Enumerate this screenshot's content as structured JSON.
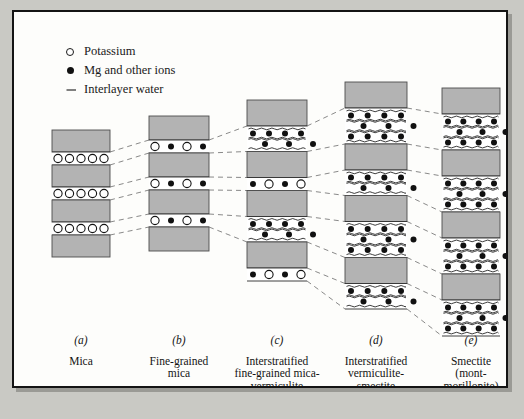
{
  "figure": {
    "legend": [
      {
        "marker": "open-circle",
        "label": "Potassium"
      },
      {
        "marker": "filled-circle",
        "label": "Mg and other ions"
      },
      {
        "marker": "wavy-dash",
        "label": "Interlayer water"
      }
    ],
    "columns": [
      {
        "index": "(a)",
        "name": "Mica",
        "name_lines": [
          "Mica"
        ],
        "x": 38,
        "width": 58,
        "top": 118,
        "slab_h": 22,
        "gap_h": 12,
        "units": 4,
        "ion_rows": [
          {
            "pattern": "KKKKK",
            "count": 5
          }
        ],
        "water": false,
        "ions": [
          "potassium"
        ]
      },
      {
        "index": "(b)",
        "name": "Fine-grained mica",
        "name_lines": [
          "Fine-grained",
          "mica"
        ],
        "x": 135,
        "width": 60,
        "top": 104,
        "slab_h": 24,
        "gap_h": 14,
        "units": 4,
        "ion_rows": [
          {
            "pattern": "KMKM",
            "count": 4
          }
        ],
        "water": false,
        "ions": [
          "potassium",
          "magnesium"
        ]
      },
      {
        "index": "(c)",
        "name": "Interstratified fine-grained mica-vermiculite",
        "name_lines": [
          "Interstratified",
          "fine-grained mica-",
          "vermiculite"
        ],
        "x": 233,
        "width": 60,
        "top": 88,
        "slab_h": 26,
        "units": 4,
        "ion_rows": [
          {
            "pattern": "MKMK",
            "count": 4
          },
          {
            "pattern": "MMMM",
            "count": 4
          }
        ],
        "water": true,
        "ions": [
          "potassium",
          "magnesium"
        ]
      },
      {
        "index": "(d)",
        "name": "Interstratified vermiculite-smectite",
        "name_lines": [
          "Interstratified",
          "vermiculite-",
          "smectite"
        ],
        "x": 331,
        "width": 62,
        "top": 70,
        "slab_h": 26,
        "units": 4,
        "ion_rows": [
          {
            "pattern": "MMMM",
            "count": 4
          }
        ],
        "water": true,
        "ions": [
          "magnesium"
        ]
      },
      {
        "index": "(e)",
        "name": "Smectite (montmorillonite)",
        "name_lines": [
          "Smectite",
          "(mont-",
          "morillonite)"
        ],
        "x": 428,
        "width": 58,
        "top": 76,
        "slab_h": 26,
        "units": 4,
        "ion_rows": [
          {
            "pattern": "MMMM",
            "count": 4
          }
        ],
        "water": true,
        "ions": [
          "magnesium"
        ]
      }
    ],
    "colors": {
      "slab_fill": "#b3b3b3",
      "slab_stroke": "#4d4d4d",
      "interlayer_fill": "#ffffff",
      "ion_fill": "#111111",
      "potassium_fill": "#ffffff",
      "connector": "#6b6b6b",
      "panel_bg": "#fdfdfb",
      "page_bg": "#c9c9c4",
      "border": "#141414"
    }
  }
}
